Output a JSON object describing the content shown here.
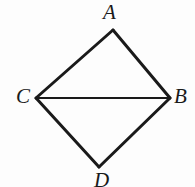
{
  "figure": {
    "kind": "geometry-diagram",
    "background_color": "#fdfdfd",
    "stroke_color": "#1a1a1a",
    "label_color": "#1a1a1a",
    "stroke_width_outline": 3.0,
    "stroke_width_diagonal": 2.2,
    "canvas": {
      "width": 195,
      "height": 187
    },
    "vertices": [
      {
        "name": "A",
        "label": "A",
        "x": 113,
        "y": 30,
        "label_x": 103,
        "label_y": 2
      },
      {
        "name": "C",
        "label": "C",
        "x": 36,
        "y": 98,
        "label_x": 16,
        "label_y": 86
      },
      {
        "name": "B",
        "label": "B",
        "x": 170,
        "y": 98,
        "label_x": 174,
        "label_y": 86
      },
      {
        "name": "D",
        "label": "D",
        "x": 99,
        "y": 167,
        "label_x": 94,
        "label_y": 170
      }
    ],
    "segments": [
      {
        "name": "segment-CA",
        "from": "C",
        "to": "A",
        "x1": 36,
        "y1": 98,
        "x2": 113,
        "y2": 30,
        "role": "outline"
      },
      {
        "name": "segment-AB",
        "from": "A",
        "to": "B",
        "x1": 113,
        "y1": 30,
        "x2": 170,
        "y2": 98,
        "role": "outline"
      },
      {
        "name": "segment-BD",
        "from": "B",
        "to": "D",
        "x1": 170,
        "y1": 98,
        "x2": 99,
        "y2": 167,
        "role": "outline"
      },
      {
        "name": "segment-DC",
        "from": "D",
        "to": "C",
        "x1": 99,
        "y1": 167,
        "x2": 36,
        "y2": 98,
        "role": "outline"
      },
      {
        "name": "segment-CB",
        "from": "C",
        "to": "B",
        "x1": 36,
        "y1": 98,
        "x2": 170,
        "y2": 98,
        "role": "diagonal"
      }
    ]
  }
}
